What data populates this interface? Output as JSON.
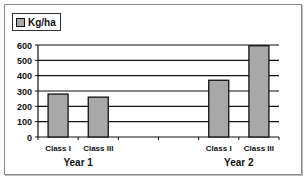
{
  "chart_data": {
    "type": "bar",
    "title": "",
    "groups": [
      {
        "label": "Year 1",
        "categories": [
          "Class I",
          "Class III"
        ],
        "values": [
          280,
          260
        ]
      },
      {
        "label": "Year 2",
        "categories": [
          "Class I",
          "Class III"
        ],
        "values": [
          370,
          595
        ]
      }
    ],
    "categories": [
      "Class I",
      "Class III",
      "",
      "",
      "Class I",
      "Class III"
    ],
    "series": [
      {
        "name": "Kg/ha",
        "values": [
          280,
          260,
          null,
          null,
          370,
          595
        ],
        "color": "#a8a8a8"
      }
    ],
    "xlabel": "",
    "ylabel": "",
    "ylim": [
      0,
      600
    ],
    "yticks": [
      "0",
      "100",
      "200",
      "300",
      "400",
      "500",
      "600"
    ],
    "grid": true,
    "legend_position": "top-left"
  },
  "legend": {
    "label": "Kg/ha"
  }
}
